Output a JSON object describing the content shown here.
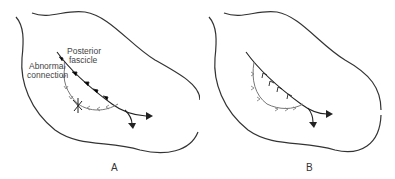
{
  "panels": [
    {
      "id": "A",
      "letter": "A",
      "labels": {
        "posterior_line1": "Posterior",
        "posterior_line2": "fascicle",
        "abnormal_line1": "Abnormal",
        "abnormal_line2": "connection"
      }
    },
    {
      "id": "B",
      "letter": "B"
    }
  ],
  "colors": {
    "outline": "#333333",
    "main_path": "#222222",
    "abnormal_path": "#777777",
    "text": "#444444"
  }
}
